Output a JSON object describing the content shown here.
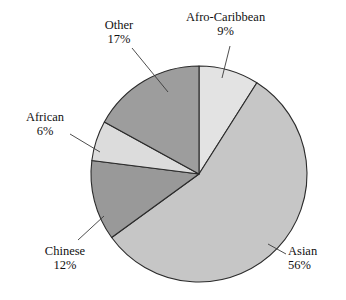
{
  "chart_data": {
    "type": "pie",
    "title": "",
    "subtitle": "",
    "xlabel": "",
    "ylabel": "",
    "legend_position": "none",
    "grid": false,
    "labels_outside": true,
    "start_angle_deg": 0,
    "direction": "clockwise",
    "categories": [
      "Afro-Caribbean",
      "Asian",
      "Chinese",
      "African",
      "Other"
    ],
    "values": [
      9,
      56,
      12,
      6,
      17
    ],
    "value_unit": "%",
    "slices": [
      {
        "label": "Afro-Caribbean",
        "value": 9,
        "value_text": "9%",
        "color": "#e3e3e3",
        "start_deg": 0,
        "end_deg": 32.4
      },
      {
        "label": "Asian",
        "value": 56,
        "value_text": "56%",
        "color": "#c6c6c6",
        "start_deg": 32.4,
        "end_deg": 234.0
      },
      {
        "label": "Chinese",
        "value": 12,
        "value_text": "12%",
        "color": "#999999",
        "start_deg": 234.0,
        "end_deg": 277.2
      },
      {
        "label": "African",
        "value": 6,
        "value_text": "6%",
        "color": "#dcdcdc",
        "start_deg": 277.2,
        "end_deg": 298.8
      },
      {
        "label": "Other",
        "value": 17,
        "value_text": "17%",
        "color": "#9d9d9d",
        "start_deg": 298.8,
        "end_deg": 360.0
      }
    ],
    "geometry": {
      "center_x": 199,
      "center_y": 174,
      "radius": 108
    },
    "style": {
      "background": "#ffffff",
      "slice_outline": "#2b2b2b",
      "leader_line": "#3a3a3a",
      "text_color": "#111111"
    }
  }
}
